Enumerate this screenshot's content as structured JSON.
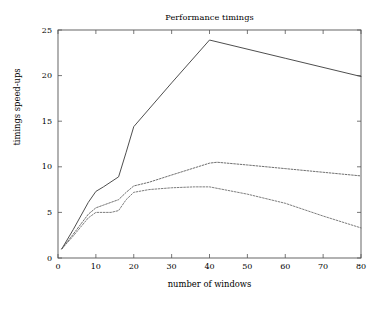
{
  "chart_data": {
    "type": "line",
    "title": "Performance timings",
    "xlabel": "number of windows",
    "ylabel": "timings speed-ups",
    "xlim": [
      0,
      80
    ],
    "ylim": [
      0,
      25
    ],
    "xticks": [
      0,
      10,
      20,
      30,
      40,
      50,
      60,
      70,
      80
    ],
    "yticks": [
      0,
      5,
      10,
      15,
      20,
      25
    ],
    "xtick_labels": [
      "0",
      "10",
      "20",
      "30",
      "40",
      "50",
      "60",
      "70",
      "80"
    ],
    "ytick_labels": [
      "0",
      "5",
      "10",
      "15",
      "20",
      "25"
    ],
    "grid": false,
    "legend": null,
    "series": [
      {
        "name": "solid",
        "style": "solid",
        "color": "#444444",
        "x": [
          1,
          4,
          8,
          10,
          12,
          16,
          18,
          20,
          30,
          40,
          60,
          80
        ],
        "values": [
          1.0,
          3.1,
          6.1,
          7.3,
          7.8,
          8.9,
          11.6,
          14.4,
          19.2,
          23.9,
          21.9,
          19.9
        ]
      },
      {
        "name": "dashed-upper",
        "style": "dashed",
        "color": "#555555",
        "x": [
          1,
          4,
          8,
          10,
          12,
          16,
          18,
          20,
          24,
          30,
          40,
          42,
          50,
          60,
          70,
          80
        ],
        "values": [
          1.0,
          2.6,
          4.8,
          5.5,
          5.8,
          6.4,
          7.2,
          7.9,
          8.3,
          9.1,
          10.4,
          10.5,
          10.2,
          9.8,
          9.4,
          9.0
        ]
      },
      {
        "name": "dashed-lower",
        "style": "dashed",
        "color": "#666666",
        "x": [
          1,
          4,
          8,
          10,
          14,
          16,
          18,
          20,
          24,
          30,
          36,
          40,
          50,
          60,
          70,
          80
        ],
        "values": [
          1.0,
          2.4,
          4.4,
          5.0,
          5.0,
          5.2,
          6.4,
          7.2,
          7.5,
          7.7,
          7.8,
          7.8,
          7.0,
          6.0,
          4.6,
          3.3
        ]
      }
    ]
  },
  "plot_geometry": {
    "left": 58,
    "right": 361,
    "top": 30,
    "bottom": 258
  }
}
